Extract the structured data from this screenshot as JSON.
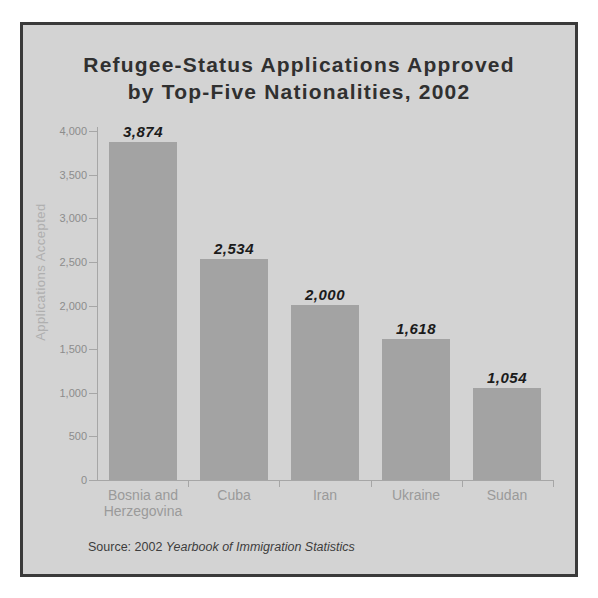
{
  "figure": {
    "page_background": "#ffffff",
    "panel_background": "#d3d3d3",
    "panel_border_color": "#3a3a3a"
  },
  "title_lines": [
    "Refugee-Status Applications Approved",
    "by Top-Five Nationalities, 2002"
  ],
  "chart_data": {
    "type": "bar",
    "title": "Refugee-Status Applications Approved by Top-Five Nationalities, 2002",
    "categories": [
      "Bosnia and Herzegovina",
      "Cuba",
      "Iran",
      "Ukraine",
      "Sudan"
    ],
    "values": [
      3874,
      2534,
      2000,
      1618,
      1054
    ],
    "value_labels": [
      "3,874",
      "2,534",
      "2,000",
      "1,618",
      "1,054"
    ],
    "xlabel": "",
    "ylabel": "Applications Accepted",
    "ylim": [
      0,
      4000
    ],
    "ytick_step": 500,
    "yticks": [
      {
        "value": 0,
        "label": "0"
      },
      {
        "value": 500,
        "label": "500"
      },
      {
        "value": 1000,
        "label": "1,000"
      },
      {
        "value": 1500,
        "label": "1,500"
      },
      {
        "value": 2000,
        "label": "2,000"
      },
      {
        "value": 2500,
        "label": "2,500"
      },
      {
        "value": 3000,
        "label": "3,000"
      },
      {
        "value": 3500,
        "label": "3,500"
      },
      {
        "value": 4000,
        "label": "4,000"
      }
    ],
    "grid": false,
    "legend": false,
    "bar_color": "#a3a3a3",
    "axis_color": "#a6a6a6",
    "value_label_color": "#1b1b1b",
    "tick_label_color": "#8c8c8c",
    "category_label_color": "#9a9a9a"
  },
  "source": {
    "prefix": "Source: 2002 ",
    "work_title": "Yearbook of Immigration Statistics"
  }
}
